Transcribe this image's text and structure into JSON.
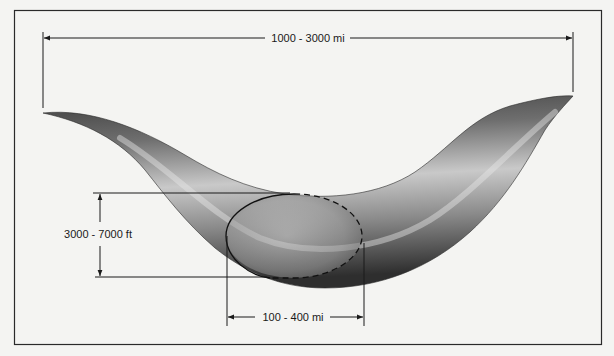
{
  "diagram": {
    "labels": {
      "length": "1000 - 3000 mi",
      "depth": "3000 - 7000 ft",
      "width": "100 - 400 mi"
    },
    "dimensions": [
      {
        "id": "length",
        "label": "1000 - 3000 mi",
        "orientation": "horizontal",
        "position": "top"
      },
      {
        "id": "depth",
        "label": "3000 - 7000 ft",
        "orientation": "vertical",
        "position": "left"
      },
      {
        "id": "width",
        "label": "100 - 400 mi",
        "orientation": "horizontal",
        "position": "bottom"
      }
    ],
    "colors": {
      "background": "#f4f4f2",
      "frame": "#2a2a2a",
      "line": "#1a1a1a",
      "tube_dark": "#3a3a3a",
      "tube_mid": "#8a8a8a",
      "tube_light": "#d8d8d8"
    }
  }
}
